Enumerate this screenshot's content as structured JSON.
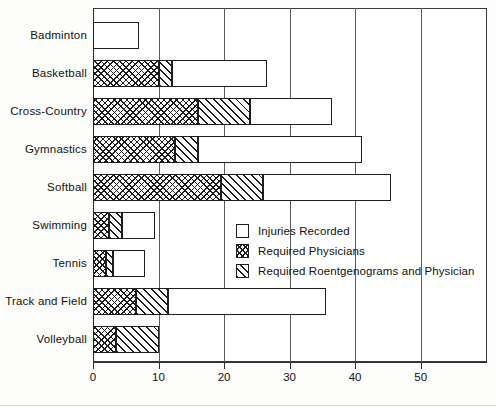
{
  "chart_data": {
    "type": "bar",
    "orientation": "horizontal",
    "stacked": true,
    "title": "",
    "xlabel": "",
    "ylabel": "",
    "xlim": [
      0,
      60
    ],
    "grid": true,
    "grid_axis": "x",
    "legend_position": "center-right",
    "categories": [
      "Badminton",
      "Basketball",
      "Cross-Country",
      "Gymnastics",
      "Softball",
      "Swimming",
      "Tennis",
      "Track and Field",
      "Volleyball"
    ],
    "xticks": [
      0,
      10,
      20,
      30,
      40,
      50
    ],
    "xticklabels": [
      "0",
      "10",
      "20",
      "30",
      "40",
      "50"
    ],
    "series": [
      {
        "name": "Required Physicians",
        "pattern": "cross-hatch",
        "values": [
          0,
          10,
          16,
          12.5,
          19.5,
          2.5,
          2,
          6.5,
          3.5
        ]
      },
      {
        "name": "Required Roentgenograms and Physician",
        "pattern": "diagonal-hatch",
        "values": [
          0,
          2,
          8,
          3.5,
          6.5,
          2,
          1,
          5,
          6.5
        ]
      },
      {
        "name": "Injuries Recorded",
        "pattern": "plain",
        "values": [
          7,
          14.5,
          12.5,
          25,
          19.5,
          5,
          5,
          24,
          0
        ]
      }
    ],
    "totals": [
      7,
      26.5,
      36.5,
      41,
      45.5,
      9.5,
      8,
      35.5,
      10
    ],
    "legend": [
      {
        "label": "Injuries Recorded",
        "pattern": "plain"
      },
      {
        "label": "Required Physicians",
        "pattern": "cross-hatch"
      },
      {
        "label": "Required Roentgenograms and Physician",
        "pattern": "diagonal-hatch"
      }
    ],
    "colors": {
      "background": "#ffffff",
      "ink": "#1d1d1d",
      "frame": "#3a3a3a",
      "grid": "#5a5a5a"
    }
  }
}
